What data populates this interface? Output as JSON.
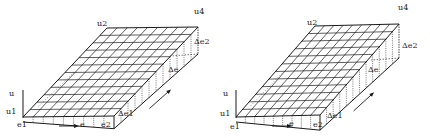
{
  "figures": [
    {
      "id": "left",
      "labels": {
        "u": "u",
        "u1": "u1",
        "u2": "u2",
        "u4": "u4",
        "e1": "e1",
        "e": "e",
        "e2": "e2",
        "delta_e1": "Δe1",
        "delta_e2": "Δe2",
        "delta_e": "Δe"
      },
      "grid": {
        "rows": 12,
        "cols": 9
      }
    },
    {
      "id": "right",
      "labels": {
        "u": "u",
        "u1": "u1",
        "u2": "u2",
        "u4": "u4",
        "e1": "e1",
        "e": "e",
        "e2": "e2",
        "delta_e1": "Δe1",
        "delta_e2": "Δe2",
        "delta_e": "Δe"
      },
      "grid": {
        "rows": 12,
        "cols": 9
      }
    }
  ],
  "colors": {
    "ink": "#1a1a1a",
    "background": "#ffffff"
  }
}
